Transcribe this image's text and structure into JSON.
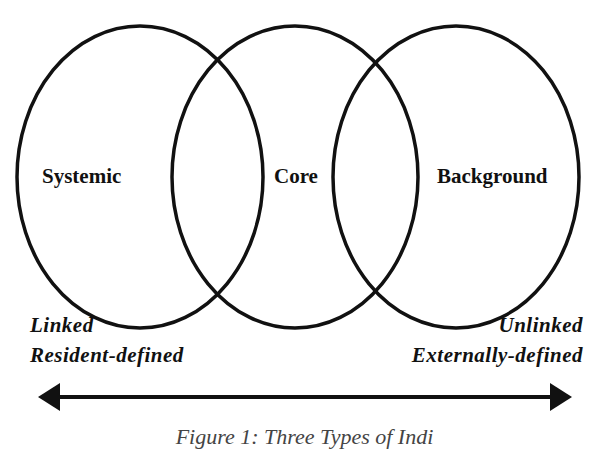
{
  "diagram": {
    "type": "venn",
    "circles": [
      {
        "label": "Systemic",
        "cx": 140,
        "cy": 178,
        "rx": 123,
        "ry": 153
      },
      {
        "label": "Core",
        "cx": 295,
        "cy": 178,
        "rx": 123,
        "ry": 153
      },
      {
        "label": "Background",
        "cx": 456,
        "cy": 178,
        "rx": 123,
        "ry": 153
      }
    ],
    "axis": {
      "left_labels": [
        "Linked",
        "Resident-defined"
      ],
      "right_labels": [
        "Unlinked",
        "Externally-defined"
      ],
      "arrow": "bidirectional"
    },
    "caption": "Figure 1: Three Types of Indi",
    "colors": {
      "stroke": "#111111",
      "background": "#ffffff"
    }
  }
}
